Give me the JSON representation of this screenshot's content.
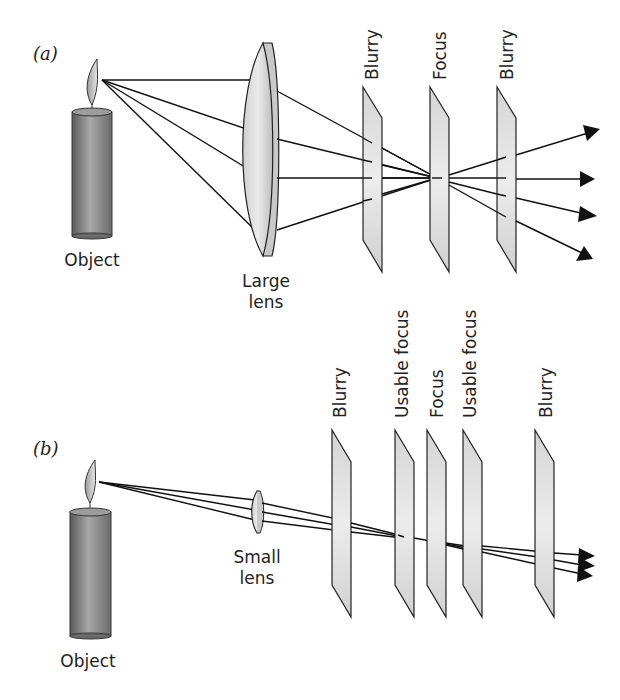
{
  "figure": {
    "panel_a": {
      "label": "(a)",
      "object_label": "Object",
      "lens_label_line1": "Large",
      "lens_label_line2": "lens",
      "planes": [
        {
          "label": "Blurry"
        },
        {
          "label": "Focus"
        },
        {
          "label": "Blurry"
        }
      ]
    },
    "panel_b": {
      "label": "(b)",
      "object_label": "Object",
      "lens_label_line1": "Small",
      "lens_label_line2": "lens",
      "planes": [
        {
          "label": "Blurry"
        },
        {
          "label": "Usable focus"
        },
        {
          "label": "Focus"
        },
        {
          "label": "Usable focus"
        },
        {
          "label": "Blurry"
        }
      ]
    },
    "colors": {
      "candle_dark": "#6e6e6e",
      "candle_light": "#b8b8b8",
      "plane_fill": "#e2e2e2",
      "line": "#111111"
    }
  }
}
